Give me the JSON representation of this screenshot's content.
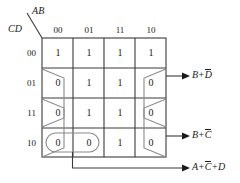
{
  "diagram": {
    "type": "karnaugh-map",
    "title": "",
    "axes": {
      "column_variable": "AB",
      "row_variable": "CD"
    },
    "column_headers": [
      "00",
      "01",
      "11",
      "10"
    ],
    "row_headers": [
      "00",
      "01",
      "11",
      "10"
    ],
    "cells": [
      [
        "1",
        "1",
        "1",
        "1"
      ],
      [
        "0",
        "1",
        "1",
        "0"
      ],
      [
        "0",
        "1",
        "1",
        "0"
      ],
      [
        "0",
        "0",
        "1",
        "0"
      ]
    ],
    "groups": [
      {
        "name": "group-b-plus-dbar",
        "output_label": {
          "term1": "B",
          "op1": "+",
          "term2": "D",
          "term2_bar": true,
          "text": "B+D̄"
        }
      },
      {
        "name": "group-b-plus-cbar",
        "output_label": {
          "term1": "B",
          "op1": "+",
          "term2": "C",
          "term2_bar": true,
          "text": "B+C̄"
        }
      },
      {
        "name": "group-a-plus-cbar-plus-d",
        "output_label": {
          "term1": "A",
          "op1": "+",
          "term2": "C",
          "term2_bar": true,
          "op2": "+",
          "term3": "D",
          "term3_bar": false,
          "text": "A+C̄+D"
        }
      }
    ],
    "colors": {
      "grid_line": "#3a3a3a",
      "loop_line": "#6b6b6b",
      "text": "#1a1a1a",
      "background": "#ffffff"
    }
  }
}
